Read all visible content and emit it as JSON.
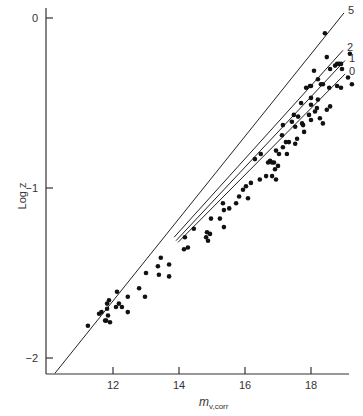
{
  "chart_data": {
    "type": "scatter",
    "title": "",
    "xlabel": "m",
    "xlabel_subscript": "v,corr",
    "ylabel": "Log z",
    "xlim": [
      10.0,
      19.3
    ],
    "ylim": [
      -2.1,
      0.1
    ],
    "xticks": [
      12,
      14,
      16,
      18
    ],
    "xtick_labels": [
      "12",
      "14",
      "16",
      "18"
    ],
    "yticks": [
      0,
      -1,
      -2
    ],
    "ytick_labels": [
      "0",
      "−1",
      "−2"
    ],
    "grid": false,
    "legend": "none; lines labeled at right end",
    "colors": {
      "points": "#111111",
      "lines": "#222222",
      "axes": "#333333"
    },
    "lines": [
      {
        "label": "5",
        "x": [
          10.24,
          19.0
        ],
        "y": [
          -2.09,
          0.03
        ]
      },
      {
        "label": "2",
        "x": [
          13.85,
          18.97
        ],
        "y": [
          -1.29,
          -0.19
        ]
      },
      {
        "label": "1",
        "x": [
          13.91,
          19.03
        ],
        "y": [
          -1.31,
          -0.25
        ]
      },
      {
        "label": "0",
        "x": [
          13.97,
          19.03
        ],
        "y": [
          -1.32,
          -0.33
        ]
      }
    ],
    "points": [
      [
        11.24,
        -1.81
      ],
      [
        11.58,
        -1.74
      ],
      [
        11.82,
        -1.71
      ],
      [
        11.65,
        -1.73
      ],
      [
        11.82,
        -1.68
      ],
      [
        11.88,
        -1.66
      ],
      [
        11.91,
        -1.79
      ],
      [
        11.85,
        -1.75
      ],
      [
        11.79,
        -1.78
      ],
      [
        11.76,
        -1.78
      ],
      [
        12.12,
        -1.61
      ],
      [
        12.18,
        -1.68
      ],
      [
        12.27,
        -1.7
      ],
      [
        12.45,
        -1.64
      ],
      [
        12.79,
        -1.59
      ],
      [
        12.97,
        -1.64
      ],
      [
        12.45,
        -1.73
      ],
      [
        12.09,
        -1.7
      ],
      [
        13.0,
        -1.5
      ],
      [
        13.36,
        -1.46
      ],
      [
        13.39,
        -1.51
      ],
      [
        13.7,
        -1.52
      ],
      [
        13.7,
        -1.45
      ],
      [
        13.45,
        -1.41
      ],
      [
        14.18,
        -1.29
      ],
      [
        14.27,
        -1.35
      ],
      [
        14.45,
        -1.24
      ],
      [
        14.15,
        -1.36
      ],
      [
        14.97,
        -1.18
      ],
      [
        15.36,
        -1.23
      ],
      [
        14.88,
        -1.31
      ],
      [
        14.85,
        -1.26
      ],
      [
        14.82,
        -1.29
      ],
      [
        14.94,
        -1.27
      ],
      [
        15.24,
        -1.18
      ],
      [
        15.33,
        -1.09
      ],
      [
        15.36,
        -1.13
      ],
      [
        15.73,
        -1.09
      ],
      [
        15.52,
        -1.12
      ],
      [
        16.09,
        -1.06
      ],
      [
        15.94,
        -1.01
      ],
      [
        15.82,
        -1.05
      ],
      [
        16.03,
        -0.99
      ],
      [
        16.18,
        -0.97
      ],
      [
        16.45,
        -0.95
      ],
      [
        16.3,
        -0.83
      ],
      [
        16.48,
        -0.8
      ],
      [
        16.82,
        -0.85
      ],
      [
        16.94,
        -0.95
      ],
      [
        16.82,
        -0.93
      ],
      [
        16.64,
        -0.93
      ],
      [
        16.91,
        -0.89
      ],
      [
        16.7,
        -0.85
      ],
      [
        16.76,
        -0.84
      ],
      [
        16.88,
        -0.85
      ],
      [
        17.0,
        -0.87
      ],
      [
        17.03,
        -0.8
      ],
      [
        17.15,
        -0.76
      ],
      [
        17.24,
        -0.73
      ],
      [
        17.12,
        -0.69
      ],
      [
        16.94,
        -0.78
      ],
      [
        17.33,
        -0.73
      ],
      [
        17.27,
        -0.8
      ],
      [
        17.52,
        -0.74
      ],
      [
        17.58,
        -0.71
      ],
      [
        17.15,
        -0.63
      ],
      [
        17.52,
        -0.64
      ],
      [
        17.79,
        -0.67
      ],
      [
        17.48,
        -0.57
      ],
      [
        17.61,
        -0.58
      ],
      [
        17.42,
        -0.61
      ],
      [
        17.73,
        -0.62
      ],
      [
        18.0,
        -0.6
      ],
      [
        18.18,
        -0.53
      ],
      [
        18.27,
        -0.59
      ],
      [
        18.36,
        -0.62
      ],
      [
        18.48,
        -0.54
      ],
      [
        18.58,
        -0.52
      ],
      [
        18.0,
        -0.51
      ],
      [
        17.94,
        -0.57
      ],
      [
        18.21,
        -0.48
      ],
      [
        17.97,
        -0.4
      ],
      [
        17.85,
        -0.41
      ],
      [
        18.09,
        -0.31
      ],
      [
        18.58,
        -0.3
      ],
      [
        18.79,
        -0.4
      ],
      [
        18.94,
        -0.3
      ],
      [
        18.21,
        -0.36
      ],
      [
        18.36,
        -0.39
      ],
      [
        18.3,
        -0.39
      ],
      [
        18.55,
        -0.41
      ],
      [
        18.91,
        -0.41
      ],
      [
        18.0,
        -0.4
      ],
      [
        19.12,
        -0.35
      ],
      [
        19.24,
        -0.39
      ],
      [
        18.48,
        -0.23
      ],
      [
        18.73,
        -0.28
      ],
      [
        18.85,
        -0.27
      ],
      [
        19.18,
        -0.21
      ],
      [
        18.79,
        -0.27
      ],
      [
        18.91,
        -0.27
      ],
      [
        18.12,
        -0.55
      ],
      [
        17.7,
        -0.5
      ],
      [
        18.42,
        -0.09
      ],
      [
        18.0,
        -0.47
      ],
      [
        17.76,
        -0.63
      ]
    ]
  }
}
